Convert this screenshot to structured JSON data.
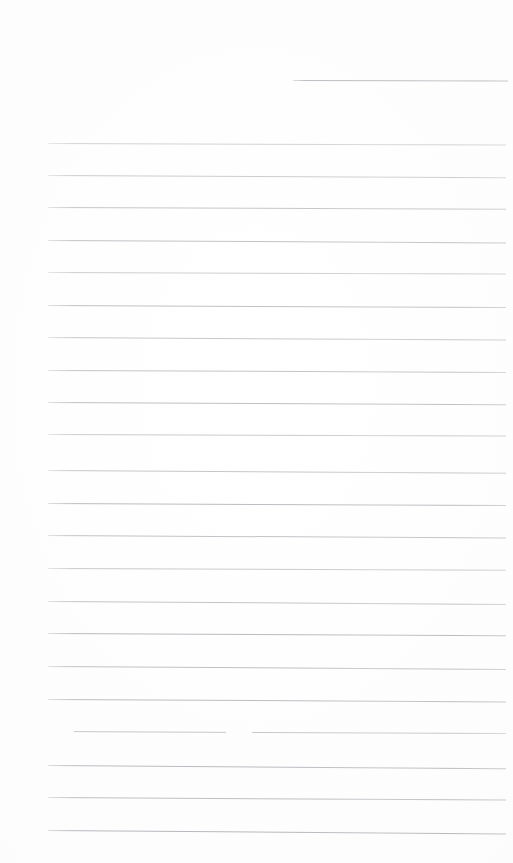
{
  "document": {
    "kind": "scanned-blank-ruled-notepad-page",
    "title": "Blank Ruled Notepad Page",
    "written_content": "",
    "page_width": 513,
    "page_height": 863,
    "background_color": "#fdfdfd",
    "rule_color": "#a9adb2",
    "total_rule_count": 23,
    "full_width_rule_count": 22,
    "partial_rule_count": 1,
    "rule_spacing_px": 32.4,
    "rule_thickness_px": 1,
    "left_margin_x": 48,
    "right_margin_x": 505,
    "first_full_rule_y": 143,
    "last_full_rule_y": 830,
    "has_handwriting": false,
    "has_printed_text": false,
    "has_header": false,
    "has_page_number": false
  },
  "rules": [
    {
      "id": "rule-00",
      "x": 293,
      "y": 80,
      "width": 215,
      "slant": 0.6,
      "opacity": 0.78,
      "partial": true,
      "break_at": null
    },
    {
      "id": "rule-01",
      "x": 48,
      "y": 143,
      "width": 458,
      "slant": 1.6,
      "opacity": 0.52,
      "partial": false,
      "break_at": null
    },
    {
      "id": "rule-02",
      "x": 48,
      "y": 175,
      "width": 458,
      "slant": 2.2,
      "opacity": 0.6,
      "partial": false,
      "break_at": null
    },
    {
      "id": "rule-03",
      "x": 48,
      "y": 207,
      "width": 458,
      "slant": 1.8,
      "opacity": 0.68,
      "partial": false,
      "break_at": null
    },
    {
      "id": "rule-04",
      "x": 48,
      "y": 240,
      "width": 458,
      "slant": 2.4,
      "opacity": 0.72,
      "partial": false,
      "break_at": null
    },
    {
      "id": "rule-05",
      "x": 48,
      "y": 272,
      "width": 458,
      "slant": 1.4,
      "opacity": 0.58,
      "partial": false,
      "break_at": null
    },
    {
      "id": "rule-06",
      "x": 48,
      "y": 305,
      "width": 458,
      "slant": 2.0,
      "opacity": 0.74,
      "partial": false,
      "break_at": null
    },
    {
      "id": "rule-07",
      "x": 48,
      "y": 337,
      "width": 458,
      "slant": 2.6,
      "opacity": 0.66,
      "partial": false,
      "break_at": null
    },
    {
      "id": "rule-08",
      "x": 48,
      "y": 370,
      "width": 458,
      "slant": 1.9,
      "opacity": 0.7,
      "partial": false,
      "break_at": null
    },
    {
      "id": "rule-09",
      "x": 48,
      "y": 402,
      "width": 458,
      "slant": 2.3,
      "opacity": 0.76,
      "partial": false,
      "break_at": null
    },
    {
      "id": "rule-10",
      "x": 48,
      "y": 434,
      "width": 458,
      "slant": 1.5,
      "opacity": 0.62,
      "partial": false,
      "break_at": null
    },
    {
      "id": "rule-11",
      "x": 48,
      "y": 470,
      "width": 458,
      "slant": 2.8,
      "opacity": 0.68,
      "partial": false,
      "break_at": null
    },
    {
      "id": "rule-12",
      "x": 48,
      "y": 503,
      "width": 458,
      "slant": 2.1,
      "opacity": 0.8,
      "partial": false,
      "break_at": null
    },
    {
      "id": "rule-13",
      "x": 48,
      "y": 535,
      "width": 458,
      "slant": 2.5,
      "opacity": 0.72,
      "partial": false,
      "break_at": null
    },
    {
      "id": "rule-14",
      "x": 48,
      "y": 568,
      "width": 458,
      "slant": 1.7,
      "opacity": 0.64,
      "partial": false,
      "break_at": null
    },
    {
      "id": "rule-15",
      "x": 48,
      "y": 601,
      "width": 458,
      "slant": 2.9,
      "opacity": 0.7,
      "partial": false,
      "break_at": null
    },
    {
      "id": "rule-16",
      "x": 48,
      "y": 633,
      "width": 458,
      "slant": 2.2,
      "opacity": 0.82,
      "partial": false,
      "break_at": null
    },
    {
      "id": "rule-17",
      "x": 48,
      "y": 666,
      "width": 458,
      "slant": 3.0,
      "opacity": 0.74,
      "partial": false,
      "break_at": null
    },
    {
      "id": "rule-18",
      "x": 48,
      "y": 699,
      "width": 458,
      "slant": 2.4,
      "opacity": 0.78,
      "partial": false,
      "break_at": null
    },
    {
      "id": "rule-19",
      "x": 48,
      "y": 731,
      "width": 458,
      "slant": 2.0,
      "opacity": 0.66,
      "partial": false,
      "break_at": 178
    },
    {
      "id": "rule-20",
      "x": 48,
      "y": 765,
      "width": 458,
      "slant": 3.2,
      "opacity": 0.8,
      "partial": false,
      "break_at": null
    },
    {
      "id": "rule-21",
      "x": 48,
      "y": 797,
      "width": 458,
      "slant": 2.6,
      "opacity": 0.76,
      "partial": false,
      "break_at": null
    },
    {
      "id": "rule-22",
      "x": 48,
      "y": 830,
      "width": 458,
      "slant": 3.4,
      "opacity": 0.84,
      "partial": false,
      "break_at": null
    }
  ]
}
